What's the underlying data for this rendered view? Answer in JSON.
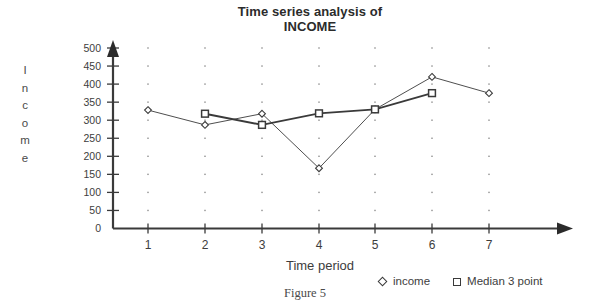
{
  "figure": {
    "caption": "Figure 5"
  },
  "chart_data": {
    "type": "line",
    "title": "Time series analysis of",
    "title_line2": "INCOME",
    "xlabel": "Time period",
    "ylabel": "Income",
    "ylabel_letters": [
      "I",
      "n",
      "c",
      "o",
      "m",
      "e"
    ],
    "x": [
      1,
      2,
      3,
      4,
      5,
      6,
      7
    ],
    "xticklabels": [
      "1",
      "2",
      "3",
      "4",
      "5",
      "6",
      "7"
    ],
    "yticks": [
      0,
      50,
      100,
      150,
      200,
      250,
      300,
      350,
      400,
      450,
      500
    ],
    "yticklabels": [
      "0",
      "50",
      "100",
      "150",
      "200",
      "250",
      "300",
      "350",
      "400",
      "450",
      "500"
    ],
    "ylim": [
      0,
      500
    ],
    "xlim": [
      0.5,
      7.5
    ],
    "grid": "dotted-points",
    "legend_position": "below-right",
    "series": [
      {
        "name": "income",
        "marker": "diamond",
        "color": "#3a3a3a",
        "x": [
          1,
          2,
          3,
          4,
          5,
          6,
          7
        ],
        "values": [
          328,
          287,
          318,
          167,
          330,
          420,
          375
        ]
      },
      {
        "name": "Median 3 point",
        "marker": "square",
        "color": "#3a3a3a",
        "x": [
          2,
          3,
          4,
          5,
          6
        ],
        "values": [
          318,
          287,
          319,
          330,
          375
        ]
      }
    ]
  },
  "axes": {
    "x_arrow": "right-arrow",
    "y_arrow": "up-arrow"
  },
  "colors": {
    "axis": "#3a3a3a",
    "text": "#3d3d3d",
    "background": "#ffffff"
  }
}
